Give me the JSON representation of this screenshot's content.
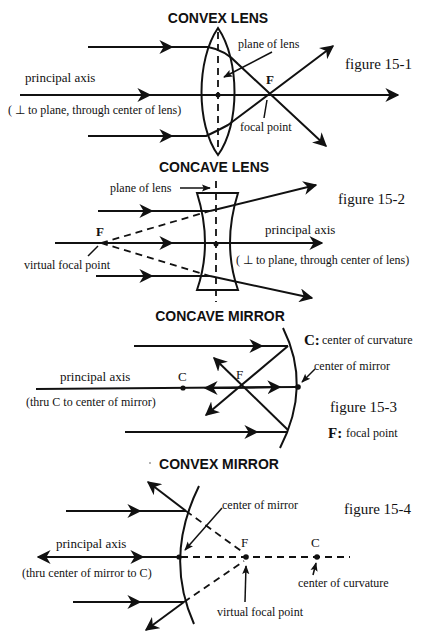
{
  "figures": [
    {
      "id": "15-1",
      "title": "CONVEX LENS",
      "caption": "figure 15-1",
      "labels": {
        "plane": "plane of lens",
        "axis": "principal axis",
        "axis_note": "( ⊥ to plane, through center of lens)",
        "focus_letter": "F",
        "focus": "focal point"
      }
    },
    {
      "id": "15-2",
      "title": "CONCAVE LENS",
      "caption": "figure 15-2",
      "labels": {
        "plane": "plane of lens",
        "axis": "principal axis",
        "axis_note": "( ⊥ to plane, through center of lens)",
        "focus_letter": "F",
        "focus": "virtual focal point"
      }
    },
    {
      "id": "15-3",
      "title": "CONCAVE MIRROR",
      "caption": "figure 15-3",
      "labels": {
        "c_def_letter": "C:",
        "c_def": "center of curvature",
        "center": "center of mirror",
        "axis": "principal axis",
        "axis_note": "(thru C to center of mirror)",
        "c_letter": "C",
        "focus_letter": "F",
        "f_def_letter": "F:",
        "f_def": "focal point"
      }
    },
    {
      "id": "15-4",
      "title": "CONVEX MIRROR",
      "caption": "figure 15-4",
      "labels": {
        "center": "center of mirror",
        "axis": "principal axis",
        "axis_note": "(thru center of mirror to C)",
        "focus_letter": "F",
        "c_letter": "C",
        "c_def": "center of curvature",
        "focus": "virtual focal point"
      }
    }
  ]
}
